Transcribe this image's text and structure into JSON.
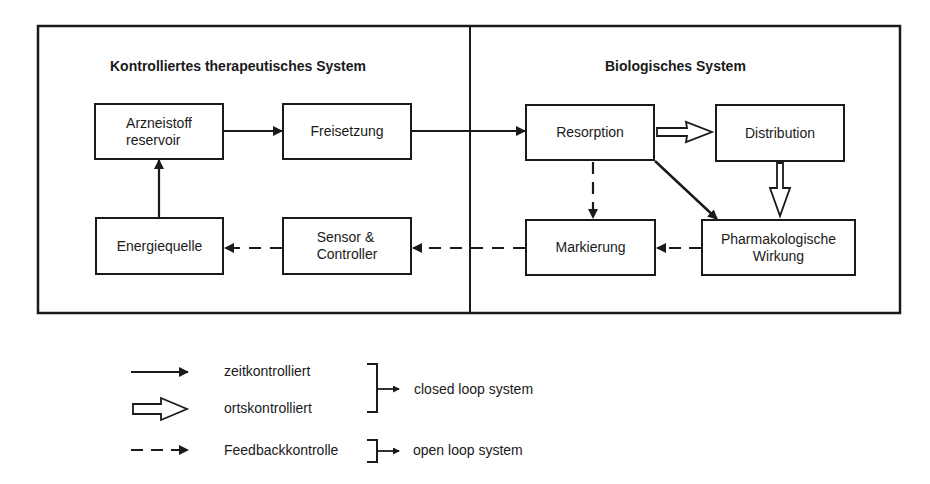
{
  "sections": {
    "left": {
      "title": "Kontrolliertes therapeutisches System"
    },
    "right": {
      "title": "Biologisches System"
    }
  },
  "nodes": {
    "arzneistoff": "Arzneistoff\nreservoir",
    "freisetzung": "Freisetzung",
    "energiequelle": "Energiequelle",
    "sensor": "Sensor &\nController",
    "resorption": "Resorption",
    "distribution": "Distribution",
    "markierung": "Markierung",
    "wirkung": "Pharmakologische\nWirkung"
  },
  "edges": [
    {
      "from": "arzneistoff",
      "to": "freisetzung",
      "type": "zeitkontrolliert"
    },
    {
      "from": "freisetzung",
      "to": "resorption",
      "type": "zeitkontrolliert"
    },
    {
      "from": "resorption",
      "to": "distribution",
      "type": "ortskontrolliert"
    },
    {
      "from": "distribution",
      "to": "wirkung",
      "type": "ortskontrolliert"
    },
    {
      "from": "resorption",
      "to": "wirkung",
      "type": "zeitkontrolliert"
    },
    {
      "from": "resorption",
      "to": "markierung",
      "type": "Feedbackkontrolle"
    },
    {
      "from": "wirkung",
      "to": "markierung",
      "type": "Feedbackkontrolle"
    },
    {
      "from": "markierung",
      "to": "sensor",
      "type": "Feedbackkontrolle"
    },
    {
      "from": "sensor",
      "to": "energiequelle",
      "type": "Feedbackkontrolle"
    },
    {
      "from": "energiequelle",
      "to": "arzneistoff",
      "type": "zeitkontrolliert"
    }
  ],
  "legend": {
    "items": [
      {
        "symbol": "solid-arrow",
        "label": "zeitkontrolliert"
      },
      {
        "symbol": "hollow-arrow",
        "label": "ortskontrolliert"
      },
      {
        "symbol": "dashed-arrow",
        "label": "Feedbackkontrolle"
      }
    ],
    "groups": [
      {
        "label": "closed loop system"
      },
      {
        "label": "open loop system"
      }
    ]
  }
}
